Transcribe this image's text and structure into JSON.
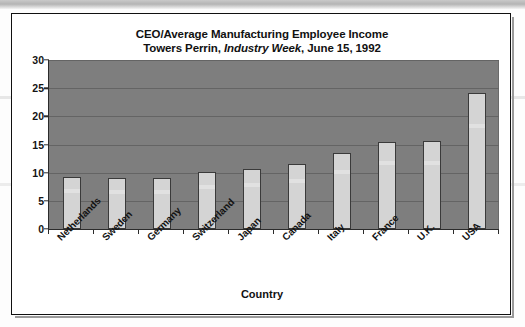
{
  "chart_data": {
    "type": "bar",
    "title": "CEO/Average Manufacturing Employee Income",
    "subtitle_prefix": "Towers Perrin, ",
    "subtitle_italic": "Industry Week",
    "subtitle_suffix": ", June 15, 1992",
    "xlabel": "Country",
    "ylabel": "",
    "ylim": [
      0,
      30
    ],
    "ytick_values": [
      0,
      5,
      10,
      15,
      20,
      25,
      30
    ],
    "ytick_labels": [
      "0",
      "5",
      "10",
      "15",
      "20",
      "25",
      "30"
    ],
    "grid": true,
    "grid_axis": "y",
    "legend": false,
    "categories": [
      "Netherlands",
      "Sweden",
      "Germany",
      "Switzerland",
      "Japan",
      "Canada",
      "Italy",
      "France",
      "U.K.",
      "USA"
    ],
    "values": [
      9.2,
      9.1,
      9.0,
      10.2,
      10.7,
      11.6,
      13.5,
      15.5,
      15.6,
      24.1
    ],
    "colors": {
      "bar_fill": "#d4d4d4",
      "bar_edge": "#3a3a3a",
      "plot_background": "#7e7e7e",
      "gridline": "#646464",
      "axis": "#2b2b2b",
      "text": "#111111",
      "page_background": "#ffffff",
      "frame_border": "#101010"
    }
  },
  "titles": {
    "line1": "CEO/Average Manufacturing Employee Income",
    "line2_prefix": "Towers Perrin, ",
    "line2_italic": "Industry Week",
    "line2_suffix": ", June 15, 1992"
  },
  "axes": {
    "x_title": "Country"
  }
}
